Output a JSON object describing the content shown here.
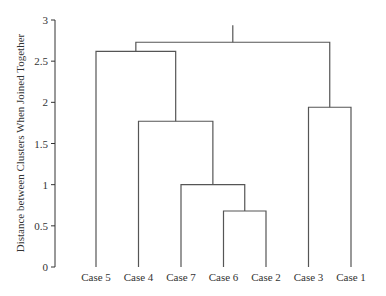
{
  "chart_data": {
    "type": "dendrogram",
    "title": "",
    "xlabel": "",
    "ylabel": "Distance between Clusters When Joined Together",
    "ylim": [
      0,
      3
    ],
    "yticks": [
      0,
      0.5,
      1,
      1.5,
      2,
      2.5,
      3
    ],
    "ytick_labels": [
      "0",
      "0.5",
      "1",
      "1.5",
      "2",
      "2.5",
      "3"
    ],
    "grid": false,
    "leaves": [
      "Case 5",
      "Case 4",
      "Case 7",
      "Case 6",
      "Case 2",
      "Case 3",
      "Case 1"
    ],
    "merges": [
      {
        "left": "Case 6",
        "right": "Case 2",
        "height": 0.68
      },
      {
        "left": "Case 7",
        "right": "Case 6 + Case 2",
        "height": 1.0
      },
      {
        "left": "Case 4",
        "right": "Case 7 + Case 6 + Case 2",
        "height": 1.77
      },
      {
        "left": "Case 5",
        "right": "Case 4 + Case 7 + Case 6 + Case 2",
        "height": 2.62
      },
      {
        "left": "Case 3",
        "right": "Case 1",
        "height": 1.94
      },
      {
        "left": "Case 5 + Case 4 + Case 7 + Case 6 + Case 2",
        "right": "Case 3 + Case 1",
        "height": 2.73
      }
    ]
  }
}
